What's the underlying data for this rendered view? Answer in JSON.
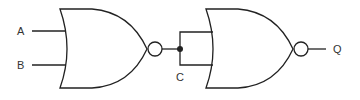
{
  "diagram": {
    "type": "logic-circuit",
    "inputs": [
      {
        "label": "A"
      },
      {
        "label": "B"
      }
    ],
    "intermediate": {
      "label": "C"
    },
    "output": {
      "label": "Q"
    },
    "gates": [
      {
        "type": "NOR",
        "inputs": [
          "A",
          "B"
        ],
        "output": "C"
      },
      {
        "type": "NOR",
        "inputs": [
          "C",
          "C"
        ],
        "output": "Q"
      }
    ]
  }
}
